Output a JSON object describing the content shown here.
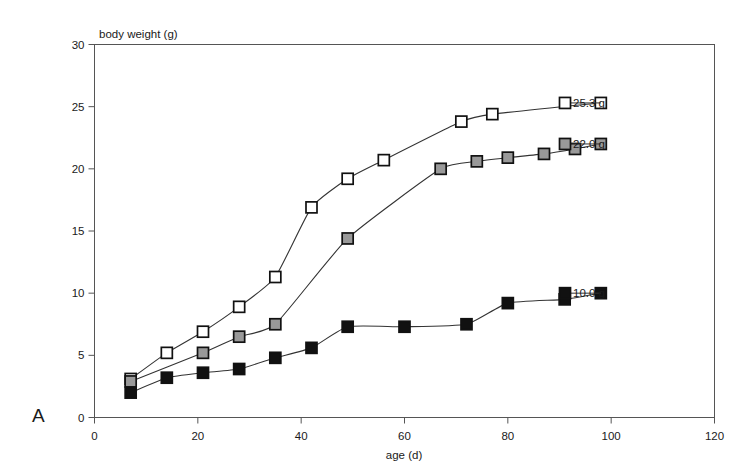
{
  "figure": {
    "panel_label": "A",
    "background": "#ffffff"
  },
  "chart_data": {
    "type": "line",
    "title": "",
    "xlabel": "age (d)",
    "ylabel": "body weight (g)",
    "xlim": [
      0,
      120
    ],
    "ylim": [
      0,
      30
    ],
    "xticks": [
      0,
      20,
      40,
      60,
      80,
      100,
      120
    ],
    "yticks": [
      0,
      5,
      10,
      15,
      20,
      25,
      30
    ],
    "xtick_labels": [
      "0",
      "20",
      "40",
      "60",
      "80",
      "100",
      "120"
    ],
    "ytick_labels": [
      "0",
      "5",
      "10",
      "15",
      "20",
      "25",
      "30"
    ],
    "grid": false,
    "legend_position": "data-labels-right",
    "marker_shape": "square",
    "series": [
      {
        "name": "open-square-series",
        "marker": "open-square",
        "fill": "#ffffff",
        "edge": "#111111",
        "endpoint_label": "25.3 g",
        "final_value": 25.3,
        "x": [
          7,
          14,
          21,
          28,
          35,
          42,
          49,
          56,
          71,
          77,
          98
        ],
        "y": [
          3.1,
          5.2,
          6.9,
          8.9,
          11.3,
          16.9,
          19.2,
          20.7,
          23.8,
          24.4,
          25.3
        ]
      },
      {
        "name": "gray-square-series",
        "marker": "gray-square",
        "fill": "#999999",
        "edge": "#111111",
        "endpoint_label": "22.0 g",
        "final_value": 22.0,
        "x": [
          7,
          21,
          28,
          35,
          49,
          67,
          74,
          80,
          87,
          93,
          98
        ],
        "y": [
          2.9,
          5.2,
          6.5,
          7.5,
          14.4,
          20.0,
          20.6,
          20.9,
          21.2,
          21.6,
          22.0
        ]
      },
      {
        "name": "black-square-series",
        "marker": "black-square",
        "fill": "#111111",
        "edge": "#111111",
        "endpoint_label": "10.0 g",
        "final_value": 10.0,
        "x": [
          7,
          14,
          21,
          28,
          35,
          42,
          49,
          60,
          72,
          80,
          91,
          98
        ],
        "y": [
          2.0,
          3.2,
          3.6,
          3.9,
          4.8,
          5.6,
          7.3,
          7.3,
          7.5,
          9.2,
          9.5,
          10.0
        ]
      }
    ]
  }
}
